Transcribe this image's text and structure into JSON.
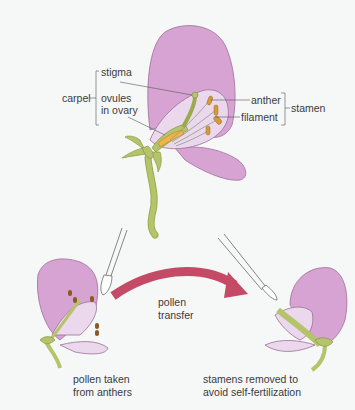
{
  "diagram": {
    "top_flower": {
      "labels": {
        "stigma": "stigma",
        "ovules": "ovules",
        "in_ovary": "in ovary",
        "carpel": "carpel",
        "anther": "anther",
        "filament": "filament",
        "stamen": "stamen"
      }
    },
    "arrow_label_line1": "pollen",
    "arrow_label_line2": "transfer",
    "left_caption_line1": "pollen taken",
    "left_caption_line2": "from anthers",
    "right_caption_line1": "stamens removed to",
    "right_caption_line2": "avoid self-fertilization",
    "colors": {
      "petal": "#d7a3d3",
      "petal_inner": "#ebd8ec",
      "stem": "#b5c46a",
      "ovary": "#f0b34a",
      "anther": "#d49a3a",
      "arrow": "#c44a66",
      "background": "#f6f7f7"
    }
  }
}
